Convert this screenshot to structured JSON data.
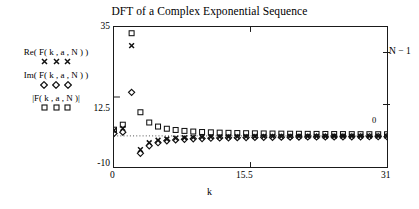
{
  "chart_data": {
    "type": "scatter",
    "title": "DFT of a Complex Exponential Sequence",
    "xlabel": "k",
    "ylabel": "",
    "xlim": [
      0,
      31
    ],
    "ylim": [
      -10,
      35
    ],
    "grid": false,
    "legend_position": "left-outside",
    "x_ticks": [
      "0",
      "15.5",
      "31"
    ],
    "x_tick_values": [
      0,
      15.5,
      31
    ],
    "y_ticks": [
      "35",
      "12.5",
      "-10"
    ],
    "y_tick_values": [
      35,
      12.5,
      -10
    ],
    "reference_line": {
      "y": 0,
      "style": "dotted"
    },
    "right_annotations": [
      {
        "label": "N − 1",
        "y": 26.5
      },
      {
        "label": "0",
        "y": 1.5
      }
    ],
    "x": [
      0,
      1,
      2,
      3,
      4,
      5,
      6,
      7,
      8,
      9,
      10,
      11,
      12,
      13,
      14,
      15,
      16,
      17,
      18,
      19,
      20,
      21,
      22,
      23,
      24,
      25,
      26,
      27,
      28,
      29,
      30,
      31
    ],
    "series": [
      {
        "name": "Re( F( k , a , N ) )",
        "marker": "x",
        "values": [
          1.8,
          2.4,
          29.0,
          -4.4,
          -2.2,
          -1.4,
          -1.0,
          -0.7,
          -0.6,
          -0.5,
          -0.4,
          -0.35,
          -0.3,
          -0.28,
          -0.25,
          -0.22,
          -0.2,
          -0.19,
          -0.18,
          -0.17,
          -0.16,
          -0.15,
          -0.14,
          -0.14,
          -0.13,
          -0.12,
          -0.12,
          -0.11,
          -0.11,
          -0.1,
          -0.1,
          -0.1
        ]
      },
      {
        "name": "Im( F( k , a , N ) )",
        "marker": "diamond",
        "values": [
          0.8,
          1.2,
          14.0,
          -5.6,
          -3.2,
          -2.2,
          -1.6,
          -1.3,
          -1.1,
          -0.95,
          -0.85,
          -0.75,
          -0.68,
          -0.62,
          -0.58,
          -0.54,
          -0.5,
          -0.47,
          -0.45,
          -0.42,
          -0.4,
          -0.38,
          -0.36,
          -0.35,
          -0.33,
          -0.32,
          -0.31,
          -0.3,
          -0.29,
          -0.28,
          -0.27,
          -0.26
        ]
      },
      {
        "name": "|F( k , a , N )|",
        "marker": "square",
        "values": [
          2.0,
          3.6,
          33.0,
          7.6,
          4.3,
          3.0,
          2.3,
          1.9,
          1.6,
          1.4,
          1.25,
          1.15,
          1.05,
          0.98,
          0.92,
          0.87,
          0.83,
          0.79,
          0.76,
          0.73,
          0.7,
          0.68,
          0.66,
          0.64,
          0.62,
          0.6,
          0.59,
          0.57,
          0.56,
          0.55,
          0.54,
          0.53
        ]
      }
    ],
    "colors": {
      "foreground": "#1a1a1a",
      "background": "#ffffff"
    }
  },
  "legend": {
    "entries": [
      {
        "label": "Re( F( k , a , N ) )",
        "marker": "x"
      },
      {
        "label": "Im( F( k , a , N ) )",
        "marker": "diamond"
      },
      {
        "label": "|F( k , a , N )|",
        "marker": "square"
      }
    ]
  }
}
